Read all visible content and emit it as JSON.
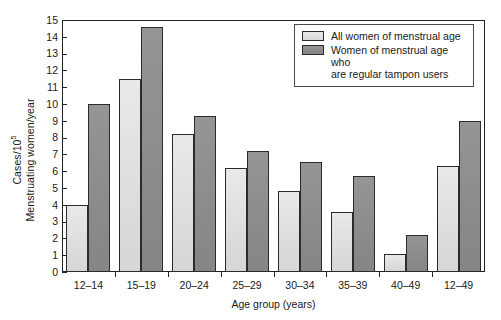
{
  "chart_data": {
    "type": "bar",
    "title": "",
    "xlabel": "Age group (years)",
    "ylabel_numerator": "Cases/10",
    "ylabel_numerator_sup": "5",
    "ylabel_denominator": "Menstruating women/year",
    "categories": [
      "12–14",
      "15–19",
      "20–24",
      "25–29",
      "30–34",
      "35–39",
      "40–49",
      "12–49"
    ],
    "series": [
      {
        "name": "All women of menstrual age",
        "color": "#dedede",
        "values": [
          4.0,
          11.5,
          8.2,
          6.2,
          4.8,
          3.55,
          1.1,
          6.3
        ]
      },
      {
        "name": "Women of menstrual age who are regular tampon users",
        "color": "#8c8c8c",
        "values": [
          10.0,
          14.6,
          9.3,
          7.2,
          6.55,
          5.7,
          2.2,
          9.0
        ]
      }
    ],
    "ylim": [
      0,
      15
    ],
    "yticks": [
      0,
      1,
      2,
      3,
      4,
      5,
      6,
      7,
      8,
      9,
      10,
      11,
      12,
      13,
      14,
      15
    ],
    "grid": false,
    "legend_position": "top-right"
  },
  "legend": {
    "entries": [
      {
        "label": "All women of menstrual age",
        "swatch": "light"
      },
      {
        "label": "Women of menstrual age who are regular tampon users",
        "swatch": "dark"
      }
    ],
    "entry2_line1": "Women of menstrual age who",
    "entry2_line2": "are regular tampon users"
  }
}
